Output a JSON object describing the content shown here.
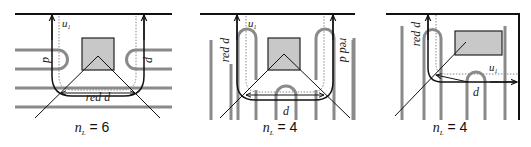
{
  "figure": {
    "colors": {
      "wire": "#8a8a8a",
      "boundary": "#111111",
      "route": "#111111",
      "dotted": "#888888",
      "obstacle_fill": "#c8c8c8",
      "obstacle_stroke": "#222222"
    },
    "panels": [
      {
        "id": "panel-1",
        "labels": {
          "u": "u",
          "u_sub": "1",
          "d_left": "d",
          "d_right": "d",
          "red_d": "red d"
        },
        "caption": {
          "var": "n",
          "sub": "L",
          "eq": " = 6"
        },
        "n_L": 6
      },
      {
        "id": "panel-2",
        "labels": {
          "u": "u",
          "u_sub": "1",
          "red_d_left": "red d",
          "red_d_right": "red d",
          "d": "d"
        },
        "caption": {
          "var": "n",
          "sub": "L",
          "eq": " = 4"
        },
        "n_L": 4
      },
      {
        "id": "panel-3",
        "labels": {
          "u": "u",
          "u_sub": "1",
          "red_d": "red d",
          "d": "d"
        },
        "caption": {
          "var": "n",
          "sub": "L",
          "eq": " = 4"
        },
        "n_L": 4
      }
    ]
  }
}
